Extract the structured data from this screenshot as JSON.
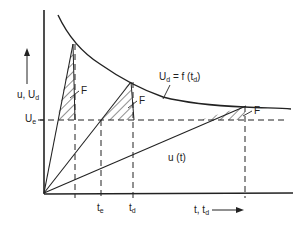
{
  "diagram": {
    "y_axis_label": {
      "main": "u, U",
      "sub": "d"
    },
    "x_axis_label": {
      "main": "t, t",
      "sub": "d"
    },
    "curve_label": {
      "main": "U",
      "sub": "d",
      "rest": " = f (t",
      "sub2": "d",
      "end": ")"
    },
    "threshold_label": {
      "main": "U",
      "sub": "e"
    },
    "ramp_label": "u (t)",
    "area_label": "F",
    "tick_te": {
      "main": "t",
      "sub": "e"
    },
    "tick_td": {
      "main": "t",
      "sub": "d"
    },
    "ink_color": "#222222"
  }
}
